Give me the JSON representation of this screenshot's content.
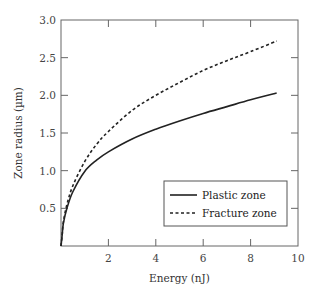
{
  "chart_data": {
    "type": "line",
    "title": "",
    "xlabel": "Energy (nJ)",
    "ylabel": "Zone radius (µm)",
    "xlim": [
      0,
      10
    ],
    "ylim": [
      0,
      3.0
    ],
    "xticks": [
      2,
      4,
      6,
      8,
      10
    ],
    "xtick_labels": [
      "2",
      "4",
      "6",
      "8",
      "10"
    ],
    "yticks": [
      0.5,
      1.0,
      1.5,
      2.0,
      2.5,
      3.0
    ],
    "ytick_labels": [
      "0.5",
      "1.0",
      "1.5",
      "2.0",
      "2.5",
      "3.0"
    ],
    "grid": false,
    "legend_position": "lower right",
    "series": [
      {
        "name": "Plastic zone",
        "style": "solid",
        "color": "#222222",
        "x": [
          0.05,
          0.1,
          0.25,
          0.5,
          1.0,
          1.5,
          2.0,
          3.0,
          4.0,
          5.0,
          6.0,
          7.0,
          8.0,
          9.1
        ],
        "y": [
          0.15,
          0.3,
          0.5,
          0.72,
          0.99,
          1.14,
          1.25,
          1.42,
          1.55,
          1.66,
          1.76,
          1.85,
          1.94,
          2.03
        ]
      },
      {
        "name": "Fracture zone",
        "style": "dashed",
        "color": "#222222",
        "x": [
          0.05,
          0.1,
          0.25,
          0.5,
          1.0,
          1.5,
          2.0,
          3.0,
          4.0,
          5.0,
          6.0,
          7.0,
          8.0,
          9.1
        ],
        "y": [
          0.15,
          0.32,
          0.55,
          0.8,
          1.12,
          1.35,
          1.52,
          1.8,
          2.0,
          2.17,
          2.33,
          2.46,
          2.58,
          2.72
        ]
      }
    ]
  }
}
